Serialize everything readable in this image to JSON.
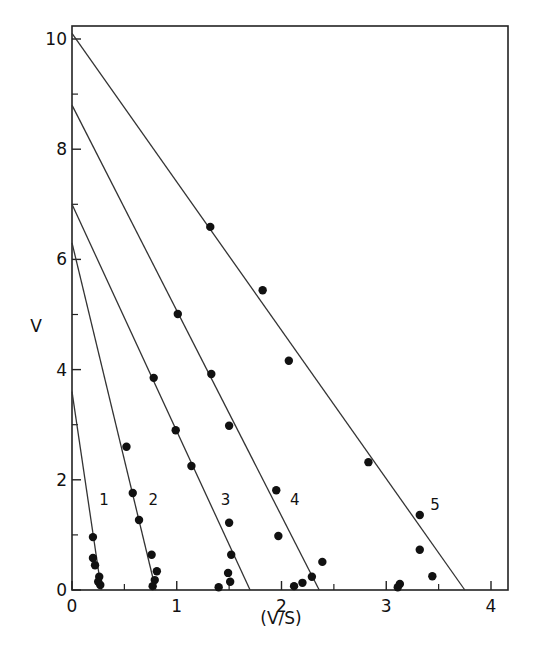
{
  "chart_data": {
    "type": "scatter",
    "title": "",
    "xlabel": "(V/S)",
    "ylabel": "V",
    "xlim": [
      0,
      4.15
    ],
    "ylim": [
      0,
      10.3
    ],
    "x_ticks": [
      0,
      1,
      2,
      3,
      4
    ],
    "y_ticks": [
      0,
      2,
      4,
      6,
      8,
      10
    ],
    "x_minor_ticks": [
      0.5,
      1.5,
      2.5,
      3.5
    ],
    "y_minor_ticks": [
      1,
      3,
      5,
      7,
      9
    ],
    "grid": false,
    "legend": "none (series labeled inline 1-5)",
    "series": [
      {
        "name": "1",
        "label_pos": [
          0.26,
          1.55
        ],
        "fit_line": {
          "y_intercept": 3.6,
          "x_intercept": 0.28
        },
        "points": [
          [
            0.2,
            0.96
          ],
          [
            0.2,
            0.58
          ],
          [
            0.22,
            0.45
          ],
          [
            0.26,
            0.24
          ],
          [
            0.27,
            0.09
          ],
          [
            0.25,
            0.15
          ]
        ]
      },
      {
        "name": "2",
        "label_pos": [
          0.73,
          1.55
        ],
        "fit_line": {
          "y_intercept": 6.3,
          "x_intercept": 0.8
        },
        "points": [
          [
            0.52,
            2.6
          ],
          [
            0.58,
            1.76
          ],
          [
            0.64,
            1.27
          ],
          [
            0.76,
            0.64
          ],
          [
            0.81,
            0.34
          ],
          [
            0.79,
            0.18
          ],
          [
            0.77,
            0.07
          ]
        ]
      },
      {
        "name": "3",
        "label_pos": [
          1.42,
          1.55
        ],
        "fit_line": {
          "y_intercept": 7.0,
          "x_intercept": 1.7
        },
        "points": [
          [
            0.78,
            3.85
          ],
          [
            0.99,
            2.9
          ],
          [
            1.14,
            2.25
          ],
          [
            1.5,
            1.22
          ],
          [
            1.52,
            0.64
          ],
          [
            1.49,
            0.31
          ],
          [
            1.51,
            0.15
          ],
          [
            1.4,
            0.05
          ]
        ]
      },
      {
        "name": "4",
        "label_pos": [
          2.08,
          1.55
        ],
        "fit_line": {
          "y_intercept": 8.8,
          "x_intercept": 2.36
        },
        "points": [
          [
            1.01,
            5.01
          ],
          [
            1.33,
            3.92
          ],
          [
            1.5,
            2.98
          ],
          [
            1.95,
            1.81
          ],
          [
            1.97,
            0.98
          ],
          [
            2.39,
            0.51
          ],
          [
            2.29,
            0.24
          ],
          [
            2.2,
            0.13
          ],
          [
            2.12,
            0.07
          ]
        ]
      },
      {
        "name": "5",
        "label_pos": [
          3.42,
          1.45
        ],
        "fit_line": {
          "y_intercept": 10.1,
          "x_intercept": 3.75
        },
        "points": [
          [
            1.32,
            6.59
          ],
          [
            1.82,
            5.44
          ],
          [
            2.07,
            4.16
          ],
          [
            2.83,
            2.32
          ],
          [
            3.32,
            1.36
          ],
          [
            3.32,
            0.73
          ],
          [
            3.44,
            0.25
          ],
          [
            3.13,
            0.11
          ],
          [
            3.11,
            0.05
          ]
        ]
      }
    ]
  }
}
